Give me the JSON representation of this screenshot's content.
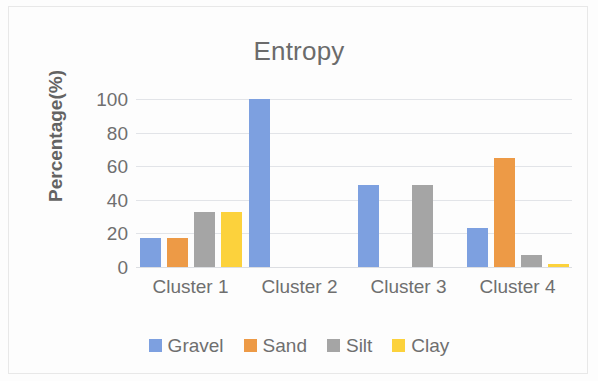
{
  "chart_data": {
    "type": "bar",
    "title": "Entropy",
    "xlabel": "",
    "ylabel": "Percentage(%)",
    "ylim": [
      0,
      100
    ],
    "yticks": [
      0,
      20,
      40,
      60,
      80,
      100
    ],
    "ytick_labels": [
      "0",
      "20",
      "40",
      "60",
      "80",
      "100"
    ],
    "grid": true,
    "legend_position": "bottom",
    "categories": [
      "Cluster 1",
      "Cluster 2",
      "Cluster 3",
      "Cluster 4"
    ],
    "series": [
      {
        "name": "Gravel",
        "color": "#7da0e0",
        "values": [
          17,
          100,
          49,
          23
        ]
      },
      {
        "name": "Sand",
        "color": "#ed9a46",
        "values": [
          17,
          0,
          0,
          65
        ]
      },
      {
        "name": "Silt",
        "color": "#a5a5a5",
        "values": [
          33,
          0,
          49,
          7
        ]
      },
      {
        "name": "Clay",
        "color": "#fcd23c",
        "values": [
          33,
          0,
          0,
          2
        ]
      }
    ]
  },
  "axis_title_color": "#636363",
  "tick_label_color": "#6f6f6f",
  "title_color": "#6b6b6b"
}
